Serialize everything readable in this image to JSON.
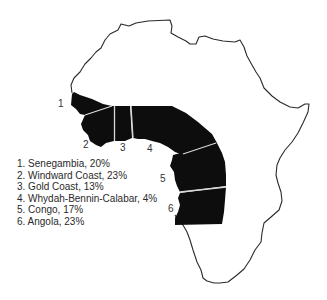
{
  "regions": [
    {
      "number": "1",
      "name": "Senegambia",
      "percent": "20%",
      "label": "1. Senegambia, 20%"
    },
    {
      "number": "2",
      "name": "Windward Coast",
      "percent": "23%",
      "label": "2. Windward Coast, 23%"
    },
    {
      "number": "3",
      "name": "Gold Coast",
      "percent": "13%",
      "label": "3. Gold Coast, 13%"
    },
    {
      "number": "4",
      "name": "Whydah-Bennin-Calabar",
      "percent": "4%",
      "label": "4. Whydah-Bennin-Calabar, 4%"
    },
    {
      "number": "5",
      "name": "Congo",
      "percent": "17%",
      "label": "5. Congo, 17%"
    },
    {
      "number": "6",
      "name": "Angola",
      "percent": "23%",
      "label": "6. Angola, 23%"
    }
  ],
  "colors": {
    "region_fill": "#0d0d0d",
    "outline": "#2a2a2a",
    "divider": "#d8d8d8"
  }
}
